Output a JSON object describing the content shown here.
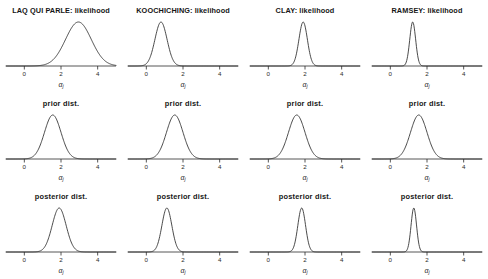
{
  "figure": {
    "background": "#ffffff",
    "stroke_color": "#2b2b2b",
    "axis_caption_symbol": "α",
    "axis_caption_subscript": "j",
    "rows": [
      "likelihood",
      "prior dist.",
      "posterior dist."
    ],
    "counties": [
      "LAQ QUI PARLE",
      "KOOCHICHING",
      "CLAY",
      "RAMSEY"
    ]
  },
  "titles": {
    "r0c0": "LAQ QUI PARLE: likelihood",
    "r0c1": "KOOCHICHING: likelihood",
    "r0c2": "CLAY: likelihood",
    "r0c3": "RAMSEY: likelihood",
    "r1c0": "prior dist.",
    "r1c1": "prior dist.",
    "r1c2": "prior dist.",
    "r1c3": "prior dist.",
    "r2c0": "posterior dist.",
    "r2c1": "posterior dist.",
    "r2c2": "posterior dist.",
    "r2c3": "posterior dist."
  },
  "chart_data": {
    "type": "line",
    "xlabel": "αj",
    "ylabel": "",
    "xlim": [
      -1.0,
      5.0
    ],
    "ticks": [
      0,
      2,
      4
    ],
    "ticklabels": [
      "0",
      "2",
      "4"
    ],
    "grid": false,
    "legend": "none",
    "curve_type": "gaussian",
    "panels": [
      {
        "row": 0,
        "col": 0,
        "county": "LAQ QUI PARLE",
        "kind": "likelihood",
        "title": "LAQ QUI PARLE: likelihood",
        "mean": 2.95,
        "sd": 0.7,
        "peak_height": 1.0
      },
      {
        "row": 0,
        "col": 1,
        "county": "KOOCHICHING",
        "kind": "likelihood",
        "title": "KOOCHICHING: likelihood",
        "mean": 0.8,
        "sd": 0.33,
        "peak_height": 1.0
      },
      {
        "row": 0,
        "col": 2,
        "county": "CLAY",
        "kind": "likelihood",
        "title": "CLAY: likelihood",
        "mean": 1.9,
        "sd": 0.23,
        "peak_height": 1.0
      },
      {
        "row": 0,
        "col": 3,
        "county": "RAMSEY",
        "kind": "likelihood",
        "title": "RAMSEY: likelihood",
        "mean": 1.22,
        "sd": 0.16,
        "peak_height": 1.0
      },
      {
        "row": 1,
        "col": 0,
        "county": "LAQ QUI PARLE",
        "kind": "prior dist.",
        "title": "prior dist.",
        "mean": 1.55,
        "sd": 0.45,
        "peak_height": 1.0
      },
      {
        "row": 1,
        "col": 1,
        "county": "KOOCHICHING",
        "kind": "prior dist.",
        "title": "prior dist.",
        "mean": 1.55,
        "sd": 0.45,
        "peak_height": 1.0
      },
      {
        "row": 1,
        "col": 2,
        "county": "CLAY",
        "kind": "prior dist.",
        "title": "prior dist.",
        "mean": 1.55,
        "sd": 0.45,
        "peak_height": 1.0
      },
      {
        "row": 1,
        "col": 3,
        "county": "RAMSEY",
        "kind": "prior dist.",
        "title": "prior dist.",
        "mean": 1.55,
        "sd": 0.45,
        "peak_height": 1.0
      },
      {
        "row": 2,
        "col": 0,
        "county": "LAQ QUI PARLE",
        "kind": "posterior dist.",
        "title": "posterior dist.",
        "mean": 1.9,
        "sd": 0.38,
        "peak_height": 1.0
      },
      {
        "row": 2,
        "col": 1,
        "county": "KOOCHICHING",
        "kind": "posterior dist.",
        "title": "posterior dist.",
        "mean": 1.12,
        "sd": 0.27,
        "peak_height": 1.0
      },
      {
        "row": 2,
        "col": 2,
        "county": "CLAY",
        "kind": "posterior dist.",
        "title": "posterior dist.",
        "mean": 1.82,
        "sd": 0.21,
        "peak_height": 1.0
      },
      {
        "row": 2,
        "col": 3,
        "county": "RAMSEY",
        "kind": "posterior dist.",
        "title": "posterior dist.",
        "mean": 1.28,
        "sd": 0.15,
        "peak_height": 1.0
      }
    ]
  }
}
